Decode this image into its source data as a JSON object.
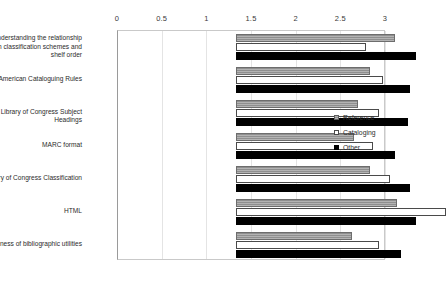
{
  "chart_data": {
    "type": "bar",
    "orientation": "horizontal",
    "title": "",
    "xlabel": "",
    "ylabel": "",
    "xlim": [
      0,
      3
    ],
    "xticks": [
      0,
      0.5,
      1,
      1.5,
      2,
      2.5,
      3
    ],
    "xtick_labels": [
      "0",
      "0.5",
      "1",
      "1.5",
      "2",
      "2.5",
      "3"
    ],
    "grid": true,
    "legend_position": "right",
    "categories": [
      "Understanding the relationship between classification schemes and shelf order",
      "Anglo-American Cataloguing Rules",
      "Library of Congress Subject Headings",
      "MARC format",
      "Library of Congress Classification",
      "HTML",
      "Awareness of bibliographic utilities"
    ],
    "series": [
      {
        "name": "Reference",
        "color": "#a0a0a0",
        "pattern": "horizontal-hatch",
        "values": [
          1.78,
          1.5,
          1.37,
          1.32,
          1.5,
          1.8,
          1.3
        ]
      },
      {
        "name": "Cataloging",
        "color": "#ffffff",
        "pattern": "solid",
        "values": [
          1.45,
          1.65,
          1.6,
          1.53,
          1.72,
          2.35,
          1.6
        ]
      },
      {
        "name": "Other",
        "color": "#000000",
        "pattern": "solid",
        "values": [
          2.02,
          1.95,
          1.92,
          1.78,
          1.95,
          2.02,
          1.85
        ]
      }
    ]
  }
}
